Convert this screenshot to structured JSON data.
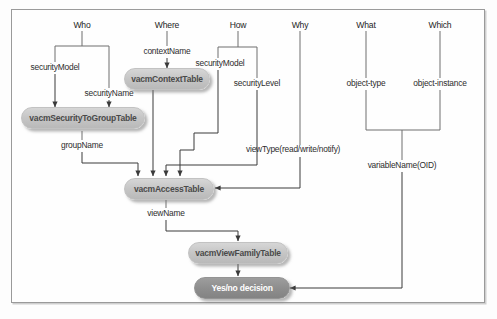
{
  "diagram": {
    "title_visible": false,
    "frame": {
      "border_color": "#9a9a9a",
      "background": "#fefefe"
    },
    "palette": {
      "table_fill": "#c6c6c6",
      "table_text": "#4a4a4a",
      "decision_fill": "#8e8e8e",
      "decision_text": "#ffffff",
      "wire": "#666666",
      "label_text": "#2d2d2d"
    },
    "questions": [
      {
        "id": "who",
        "label": "Who"
      },
      {
        "id": "where",
        "label": "Where"
      },
      {
        "id": "how",
        "label": "How"
      },
      {
        "id": "why",
        "label": "Why"
      },
      {
        "id": "what",
        "label": "What"
      },
      {
        "id": "which",
        "label": "Which"
      }
    ],
    "edge_labels": [
      {
        "id": "security-model-who",
        "label": "securityModel"
      },
      {
        "id": "security-name",
        "label": "securityName"
      },
      {
        "id": "context-name",
        "label": "contextName"
      },
      {
        "id": "security-model-how",
        "label": "securityModel"
      },
      {
        "id": "security-level",
        "label": "securityLevel"
      },
      {
        "id": "group-name",
        "label": "groupName"
      },
      {
        "id": "view-type",
        "label": "viewType(read/write/notify)"
      },
      {
        "id": "object-type",
        "label": "object-type"
      },
      {
        "id": "object-instance",
        "label": "object-instance"
      },
      {
        "id": "variable-name",
        "label": "variableName(OID)"
      },
      {
        "id": "view-name",
        "label": "viewName"
      }
    ],
    "nodes": [
      {
        "id": "vacm-context-table",
        "label": "vacmContextTable",
        "kind": "table"
      },
      {
        "id": "vacm-security-to-group-table",
        "label": "vacmSecurityToGroupTable",
        "kind": "table"
      },
      {
        "id": "vacm-access-table",
        "label": "vacmAccessTable",
        "kind": "table"
      },
      {
        "id": "vacm-view-family-table",
        "label": "vacmViewFamilyTable",
        "kind": "table"
      },
      {
        "id": "yes-no-decision",
        "label": "Yes/no decision",
        "kind": "decision"
      }
    ]
  }
}
